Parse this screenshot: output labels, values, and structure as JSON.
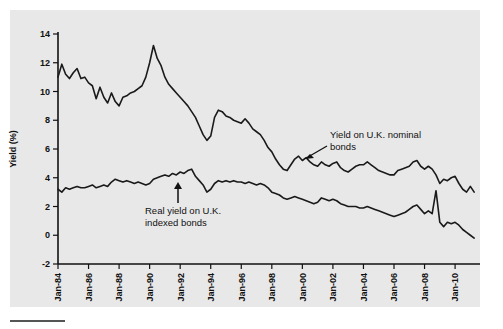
{
  "figure": {
    "background_color": "#ffffff",
    "panel_color": "#e8e8e8",
    "line_color": "#1a1a1a"
  },
  "annotations": {
    "nominal": {
      "line1": "Yield on U.K. nominal",
      "line2": "bonds"
    },
    "real": {
      "line1": "Real yield on U.K.",
      "line2": "indexed bonds"
    }
  },
  "chart_data": {
    "type": "line",
    "title": "",
    "xlabel": "",
    "ylabel": "Yield (%)",
    "ylim": [
      -2,
      14
    ],
    "yticks": [
      -2,
      0,
      2,
      4,
      6,
      8,
      10,
      12,
      14
    ],
    "grid": false,
    "legend_position": "inline-annotations",
    "x_tick_labels": [
      "Jan-84",
      "Jan-86",
      "Jan-88",
      "Jan-90",
      "Jan-92",
      "Jan-94",
      "Jan-96",
      "Jan-98",
      "Jan-00",
      "Jan-02",
      "Jan-04",
      "Jan-06",
      "Jan-08",
      "Jan-10"
    ],
    "x_tick_values": [
      1984.0,
      1986.0,
      1988.0,
      1990.0,
      1992.0,
      1994.0,
      1996.0,
      1998.0,
      2000.0,
      2002.0,
      2004.0,
      2006.0,
      2008.0,
      2010.0
    ],
    "xlim": [
      1984.0,
      2011.5
    ],
    "series": [
      {
        "name": "Yield on U.K. nominal bonds",
        "x": [
          1984.0,
          1984.25,
          1984.5,
          1984.75,
          1985.0,
          1985.25,
          1985.5,
          1985.75,
          1986.0,
          1986.25,
          1986.5,
          1986.75,
          1987.0,
          1987.25,
          1987.5,
          1987.75,
          1988.0,
          1988.25,
          1988.5,
          1988.75,
          1989.0,
          1989.25,
          1989.5,
          1989.75,
          1990.0,
          1990.25,
          1990.5,
          1990.75,
          1991.0,
          1991.25,
          1991.5,
          1991.75,
          1992.0,
          1992.25,
          1992.5,
          1992.75,
          1993.0,
          1993.25,
          1993.5,
          1993.75,
          1994.0,
          1994.25,
          1994.5,
          1994.75,
          1995.0,
          1995.25,
          1995.5,
          1995.75,
          1996.0,
          1996.25,
          1996.5,
          1996.75,
          1997.0,
          1997.25,
          1997.5,
          1997.75,
          1998.0,
          1998.25,
          1998.5,
          1998.75,
          1999.0,
          1999.25,
          1999.5,
          1999.75,
          2000.0,
          2000.25,
          2000.5,
          2000.75,
          2001.0,
          2001.25,
          2001.5,
          2001.75,
          2002.0,
          2002.25,
          2002.5,
          2002.75,
          2003.0,
          2003.25,
          2003.5,
          2003.75,
          2004.0,
          2004.25,
          2004.5,
          2004.75,
          2005.0,
          2005.25,
          2005.5,
          2005.75,
          2006.0,
          2006.25,
          2006.5,
          2006.75,
          2007.0,
          2007.25,
          2007.5,
          2007.75,
          2008.0,
          2008.25,
          2008.5,
          2008.75,
          2009.0,
          2009.25,
          2009.5,
          2009.75,
          2010.0,
          2010.25,
          2010.5,
          2010.75,
          2011.0,
          2011.25
        ],
        "values": [
          11.0,
          11.9,
          11.2,
          10.9,
          11.3,
          11.6,
          10.9,
          11.0,
          10.6,
          10.4,
          9.5,
          10.3,
          9.6,
          9.2,
          9.9,
          9.3,
          9.0,
          9.6,
          9.7,
          9.9,
          10.0,
          10.2,
          10.4,
          11.0,
          12.0,
          13.2,
          12.3,
          11.8,
          11.0,
          10.5,
          10.2,
          9.9,
          9.6,
          9.3,
          9.0,
          8.6,
          8.2,
          7.6,
          7.0,
          6.6,
          6.9,
          8.2,
          8.7,
          8.6,
          8.3,
          8.2,
          8.0,
          7.9,
          7.8,
          8.1,
          7.8,
          7.4,
          7.2,
          7.0,
          6.6,
          6.1,
          5.8,
          5.3,
          4.9,
          4.6,
          4.5,
          4.9,
          5.3,
          5.5,
          5.2,
          5.4,
          5.1,
          4.9,
          4.8,
          5.1,
          4.9,
          4.8,
          5.0,
          5.1,
          4.7,
          4.5,
          4.4,
          4.6,
          4.8,
          4.9,
          4.9,
          5.1,
          4.9,
          4.7,
          4.5,
          4.4,
          4.3,
          4.2,
          4.2,
          4.5,
          4.6,
          4.7,
          4.8,
          5.1,
          5.2,
          4.8,
          4.6,
          4.8,
          4.6,
          4.2,
          3.6,
          3.9,
          3.8,
          4.0,
          4.1,
          3.6,
          3.2,
          3.0,
          3.4,
          3.0
        ]
      },
      {
        "name": "Real yield on U.K. indexed bonds",
        "x": [
          1984.0,
          1984.25,
          1984.5,
          1984.75,
          1985.0,
          1985.25,
          1985.5,
          1985.75,
          1986.0,
          1986.25,
          1986.5,
          1986.75,
          1987.0,
          1987.25,
          1987.5,
          1987.75,
          1988.0,
          1988.25,
          1988.5,
          1988.75,
          1989.0,
          1989.25,
          1989.5,
          1989.75,
          1990.0,
          1990.25,
          1990.5,
          1990.75,
          1991.0,
          1991.25,
          1991.5,
          1991.75,
          1992.0,
          1992.25,
          1992.5,
          1992.75,
          1993.0,
          1993.25,
          1993.5,
          1993.75,
          1994.0,
          1994.25,
          1994.5,
          1994.75,
          1995.0,
          1995.25,
          1995.5,
          1995.75,
          1996.0,
          1996.25,
          1996.5,
          1996.75,
          1997.0,
          1997.25,
          1997.5,
          1997.75,
          1998.0,
          1998.25,
          1998.5,
          1998.75,
          1999.0,
          1999.25,
          1999.5,
          1999.75,
          2000.0,
          2000.25,
          2000.5,
          2000.75,
          2001.0,
          2001.25,
          2001.5,
          2001.75,
          2002.0,
          2002.25,
          2002.5,
          2002.75,
          2003.0,
          2003.25,
          2003.5,
          2003.75,
          2004.0,
          2004.25,
          2004.5,
          2004.75,
          2005.0,
          2005.25,
          2005.5,
          2005.75,
          2006.0,
          2006.25,
          2006.5,
          2006.75,
          2007.0,
          2007.25,
          2007.5,
          2007.75,
          2008.0,
          2008.25,
          2008.5,
          2008.75,
          2009.0,
          2009.25,
          2009.5,
          2009.75,
          2010.0,
          2010.25,
          2010.5,
          2010.75,
          2011.0,
          2011.25
        ],
        "values": [
          3.2,
          3.0,
          3.3,
          3.2,
          3.3,
          3.4,
          3.3,
          3.3,
          3.4,
          3.5,
          3.3,
          3.4,
          3.5,
          3.4,
          3.7,
          3.9,
          3.8,
          3.7,
          3.8,
          3.7,
          3.6,
          3.7,
          3.6,
          3.5,
          3.6,
          3.9,
          4.0,
          4.1,
          4.2,
          4.1,
          4.3,
          4.2,
          4.4,
          4.3,
          4.5,
          4.6,
          4.1,
          3.8,
          3.5,
          3.0,
          3.2,
          3.6,
          3.8,
          3.7,
          3.8,
          3.7,
          3.8,
          3.7,
          3.7,
          3.6,
          3.7,
          3.6,
          3.5,
          3.6,
          3.5,
          3.3,
          3.0,
          2.9,
          2.8,
          2.6,
          2.5,
          2.6,
          2.7,
          2.6,
          2.5,
          2.4,
          2.3,
          2.2,
          2.3,
          2.6,
          2.5,
          2.4,
          2.5,
          2.4,
          2.2,
          2.1,
          2.0,
          2.0,
          2.0,
          1.9,
          1.9,
          2.0,
          1.9,
          1.8,
          1.7,
          1.6,
          1.5,
          1.4,
          1.3,
          1.4,
          1.5,
          1.6,
          1.8,
          2.0,
          2.1,
          1.8,
          1.5,
          1.7,
          1.5,
          3.1,
          0.9,
          0.6,
          0.9,
          0.8,
          0.9,
          0.7,
          0.4,
          0.2,
          0.0,
          -0.2
        ]
      }
    ]
  }
}
